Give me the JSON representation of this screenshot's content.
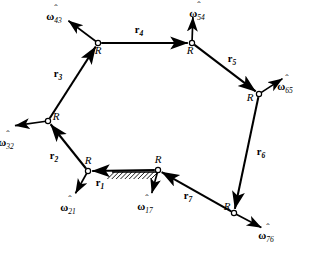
{
  "figure": {
    "background_color": "#ffffff",
    "stroke_color": "#000000"
  },
  "joints": [
    {
      "id": "J1",
      "label": "R",
      "x": 88,
      "y": 171,
      "label_x": 88,
      "label_y": 164,
      "grounded": false
    },
    {
      "id": "J2",
      "label": "R",
      "x": 48,
      "y": 121,
      "label_x": 56,
      "label_y": 120,
      "grounded": false
    },
    {
      "id": "J3",
      "label": "R",
      "x": 98,
      "y": 43,
      "label_x": 98,
      "label_y": 54,
      "grounded": false
    },
    {
      "id": "J4",
      "label": "R",
      "x": 192,
      "y": 43,
      "label_x": 190,
      "label_y": 54,
      "grounded": false
    },
    {
      "id": "J5",
      "label": "R",
      "x": 259,
      "y": 94,
      "label_x": 250,
      "label_y": 101,
      "grounded": false
    },
    {
      "id": "J6",
      "label": "R",
      "x": 234,
      "y": 213,
      "label_x": 227,
      "label_y": 210,
      "grounded": false
    },
    {
      "id": "J7",
      "label": "R",
      "x": 158,
      "y": 170,
      "label_x": 158,
      "label_y": 163,
      "grounded": true
    }
  ],
  "links": [
    {
      "id": "r1",
      "label": "r",
      "sub": "1",
      "from": "J7",
      "to": "J1",
      "label_x": 100,
      "label_y": 186,
      "double": true
    },
    {
      "id": "r2",
      "label": "r",
      "sub": "2",
      "from": "J1",
      "to": "J2",
      "label_x": 54,
      "label_y": 159,
      "double": false
    },
    {
      "id": "r3",
      "label": "r",
      "sub": "3",
      "from": "J2",
      "to": "J3",
      "label_x": 58,
      "label_y": 77,
      "double": false
    },
    {
      "id": "r4",
      "label": "r",
      "sub": "4",
      "from": "J3",
      "to": "J4",
      "label_x": 139,
      "label_y": 33,
      "double": true
    },
    {
      "id": "r5",
      "label": "r",
      "sub": "5",
      "from": "J4",
      "to": "J5",
      "label_x": 232,
      "label_y": 62,
      "double": false
    },
    {
      "id": "r6",
      "label": "r",
      "sub": "6",
      "from": "J5",
      "to": "J6",
      "label_x": 261,
      "label_y": 155,
      "double": false
    },
    {
      "id": "r7",
      "label": "r",
      "sub": "7",
      "from": "J6",
      "to": "J7",
      "label_x": 188,
      "label_y": 199,
      "double": false
    }
  ],
  "axes": [
    {
      "id": "w43",
      "label": "ω",
      "sub": "43",
      "joint": "J3",
      "tip_x": 66,
      "tip_y": 19,
      "label_x": 54,
      "label_y": 20,
      "hat_x": 56,
      "hat_y": 12
    },
    {
      "id": "w54",
      "label": "ω",
      "sub": "54",
      "joint": "J4",
      "tip_x": 193,
      "tip_y": 14,
      "label_x": 197,
      "label_y": 17,
      "hat_x": 199,
      "hat_y": 9
    },
    {
      "id": "w65",
      "label": "ω",
      "sub": "65",
      "joint": "J5",
      "tip_x": 285,
      "tip_y": 77,
      "label_x": 285,
      "label_y": 90,
      "hat_x": 287,
      "hat_y": 82
    },
    {
      "id": "w76",
      "label": "ω",
      "sub": "76",
      "joint": "J6",
      "tip_x": 264,
      "tip_y": 229,
      "label_x": 266,
      "label_y": 239,
      "hat_x": 268,
      "hat_y": 231
    },
    {
      "id": "w17",
      "label": "ω",
      "sub": "17",
      "joint": "J7",
      "tip_x": 151,
      "tip_y": 196,
      "label_x": 145,
      "label_y": 210,
      "hat_x": 147,
      "hat_y": 202
    },
    {
      "id": "w21",
      "label": "ω",
      "sub": "21",
      "joint": "J1",
      "tip_x": 74,
      "tip_y": 196,
      "label_x": 68,
      "label_y": 211,
      "hat_x": 70,
      "hat_y": 203
    },
    {
      "id": "w32",
      "label": "ω",
      "sub": "32",
      "joint": "J2",
      "tip_x": 12,
      "tip_y": 126,
      "label_x": 6,
      "label_y": 146,
      "hat_x": 8,
      "hat_y": 138
    }
  ],
  "ground": {
    "id": "ground-hatch",
    "line_x1": 112,
    "line_x2": 160,
    "line_y": 172,
    "hatch_count": 11,
    "hatch_length": 7
  }
}
